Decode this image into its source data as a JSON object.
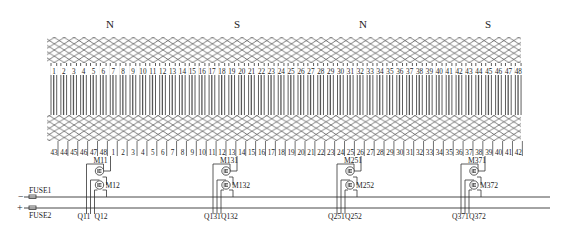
{
  "diagram": {
    "type": "motor-winding-schematic",
    "poles": [
      {
        "label": "N",
        "x": 110
      },
      {
        "label": "S",
        "x": 237
      },
      {
        "label": "N",
        "x": 363
      },
      {
        "label": "S",
        "x": 488
      }
    ],
    "slot_count": 48,
    "top_slot_labels": [
      "1",
      "2",
      "3",
      "4",
      "5",
      "6",
      "7",
      "8",
      "9",
      "10",
      "11",
      "12",
      "13",
      "14",
      "15",
      "16",
      "17",
      "18",
      "19",
      "20",
      "21",
      "22",
      "23",
      "24",
      "25",
      "26",
      "27",
      "28",
      "29",
      "30",
      "31",
      "32",
      "33",
      "34",
      "35",
      "36",
      "37",
      "38",
      "39",
      "40",
      "41",
      "42",
      "43",
      "44",
      "45",
      "46",
      "47",
      "48"
    ],
    "bottom_slot_labels": [
      "43",
      "44",
      "45",
      "46",
      "47",
      "48",
      "1",
      "2",
      "3",
      "4",
      "5",
      "6",
      "7",
      "8",
      "9",
      "10",
      "11",
      "12",
      "13",
      "14",
      "15",
      "16",
      "17",
      "18",
      "19",
      "20",
      "21",
      "22",
      "23",
      "24",
      "25",
      "26",
      "27",
      "28",
      "29",
      "30",
      "31",
      "32",
      "33",
      "34",
      "35",
      "36",
      "37",
      "38",
      "39",
      "40",
      "41",
      "42"
    ],
    "bridges": [
      {
        "upper_switch": "M11",
        "lower_switch": "M12",
        "q_left": "Q11",
        "q_right": "Q12",
        "tap_slot": "1"
      },
      {
        "upper_switch": "M131",
        "lower_switch": "M132",
        "q_left": "Q131",
        "q_right": "Q132",
        "tap_slot": "13"
      },
      {
        "upper_switch": "M251",
        "lower_switch": "M252",
        "q_left": "Q251",
        "q_right": "Q252",
        "tap_slot": "25"
      },
      {
        "upper_switch": "M371",
        "lower_switch": "M372",
        "q_left": "Q371",
        "q_right": "Q372",
        "tap_slot": "37"
      }
    ],
    "bus": {
      "negative": {
        "sign": "−",
        "fuse": "FUSE1"
      },
      "positive": {
        "sign": "+",
        "fuse": "FUSE2"
      }
    },
    "colors": {
      "line": "#333333",
      "hatch": "#444444",
      "background": "#ffffff"
    }
  }
}
